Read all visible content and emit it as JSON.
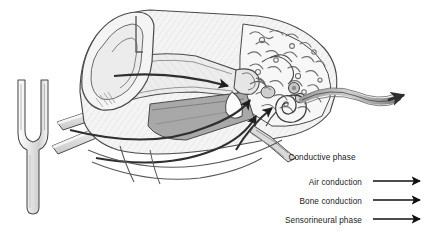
{
  "figure": {
    "type": "anatomical-diagram",
    "background_color": "#ffffff"
  },
  "legend": {
    "conductive": {
      "label": "Conductive phase",
      "has_arrow": false
    },
    "rows": [
      {
        "id": "air-conduction",
        "label": "Air conduction",
        "arrow": "→",
        "arrow_color": "#111111"
      },
      {
        "id": "bone-conduction",
        "label": "Bone conduction",
        "arrow": "→",
        "arrow_color": "#111111"
      },
      {
        "id": "sensorineural",
        "label": "Sensorineural phase",
        "arrow": "→",
        "arrow_color": "#111111"
      }
    ]
  },
  "parts": {
    "tuning_fork": "tuning-fork",
    "pinna": "outer-ear-pinna",
    "ear_canal": "external-auditory-canal",
    "mastoid_bone": "trabecular-bone",
    "ossicles": "middle-ear-ossicles",
    "cochlea": "cochlea-spiral",
    "auditory_nerve": "auditory-nerve",
    "bone_bars": "bone-conduction-bars"
  },
  "colors": {
    "outline": "#3a3a3a",
    "light_fill": "#f2f2f2",
    "mid_fill": "#d8d8d8",
    "dark_fill": "#a8a8a8",
    "darker_fill": "#8f8f8f",
    "text": "#1a1a1a",
    "arrow": "#111111"
  }
}
